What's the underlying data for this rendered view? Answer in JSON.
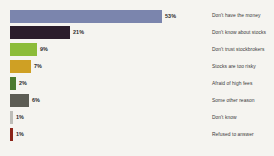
{
  "chart_data": {
    "type": "bar",
    "orientation": "horizontal",
    "title": "",
    "subtitle": "",
    "xlabel": "",
    "ylabel": "",
    "grid": false,
    "legend_position": "right",
    "xlim": [
      0,
      53
    ],
    "categories": [
      "Don't have the money",
      "Don't know about stocks",
      "Don't trust stockbrokers",
      "Stocks are too risky",
      "Afraid of high fees",
      "Some other reason",
      "Don't know",
      "Refused to answer"
    ],
    "values": [
      53,
      21,
      9,
      7,
      2,
      6,
      1,
      1
    ],
    "value_labels": [
      "53%",
      "21%",
      "9%",
      "7%",
      "2%",
      "6%",
      "1%",
      "1%"
    ],
    "colors": [
      "#7b85ad",
      "#2b1d2b",
      "#8cbc3a",
      "#cfa024",
      "#4c7a2e",
      "#5c5c54",
      "#bdbdb8",
      "#8c2418"
    ],
    "background_color": "#f5f4f0"
  },
  "bars": [
    {
      "label": "Don't have the money",
      "value": 53,
      "value_label": "53%",
      "color": "#7b85ad",
      "width_px": 152,
      "top_px": 10
    },
    {
      "label": "Don't know about stocks",
      "value": 21,
      "value_label": "21%",
      "color": "#2b1d2b",
      "width_px": 60,
      "top_px": 26
    },
    {
      "label": "Don't trust stockbrokers",
      "value": 9,
      "value_label": "9%",
      "color": "#8cbc3a",
      "width_px": 27,
      "top_px": 43
    },
    {
      "label": "Stocks are too risky",
      "value": 7,
      "value_label": "7%",
      "color": "#cfa024",
      "width_px": 21,
      "top_px": 60
    },
    {
      "label": "Afraid of high fees",
      "value": 2,
      "value_label": "2%",
      "color": "#4c7a2e",
      "width_px": 6,
      "top_px": 77
    },
    {
      "label": "Some other reason",
      "value": 6,
      "value_label": "6%",
      "color": "#5c5c54",
      "width_px": 19,
      "top_px": 94
    },
    {
      "label": "Don't know",
      "value": 1,
      "value_label": "1%",
      "color": "#bdbdb8",
      "width_px": 3,
      "top_px": 111
    },
    {
      "label": "Refused to answer",
      "value": 1,
      "value_label": "1%",
      "color": "#8c2418",
      "width_px": 3,
      "top_px": 128
    }
  ],
  "legend": {
    "items": [
      {
        "label": "Don't have the money",
        "top_px": 14
      },
      {
        "label": "Don't know about stocks",
        "top_px": 31
      },
      {
        "label": "Don't trust stockbrokers",
        "top_px": 48
      },
      {
        "label": "Stocks are too risky",
        "top_px": 65
      },
      {
        "label": "Afraid of high fees",
        "top_px": 82
      },
      {
        "label": "Some other reason",
        "top_px": 99
      },
      {
        "label": "Don't know",
        "top_px": 116
      },
      {
        "label": "Refused to answer",
        "top_px": 133
      }
    ]
  }
}
